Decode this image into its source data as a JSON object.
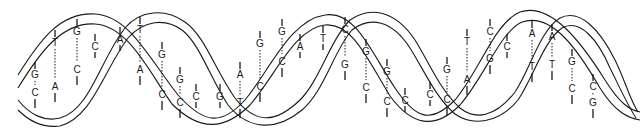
{
  "figure": {
    "stroke_color": "#1a1a1a",
    "background": "#ffffff"
  },
  "base_pairs": [
    {
      "x": 35,
      "top": "G",
      "bottom": "C",
      "ty": 78,
      "by": 96
    },
    {
      "x": 55,
      "top": "T",
      "bottom": "A",
      "ty": 46,
      "by": 90
    },
    {
      "x": 77,
      "top": "G",
      "bottom": "C",
      "ty": 35,
      "by": 73
    },
    {
      "x": 95,
      "top": "C",
      "bottom": "",
      "ty": 50,
      "by": 0
    },
    {
      "x": 120,
      "top": "A",
      "bottom": "",
      "ty": 43,
      "by": 0
    },
    {
      "x": 140,
      "top": "T",
      "bottom": "A",
      "ty": 33,
      "by": 73
    },
    {
      "x": 162,
      "top": "G",
      "bottom": "C",
      "ty": 58,
      "by": 98
    },
    {
      "x": 180,
      "top": "G",
      "bottom": "C",
      "ty": 83,
      "by": 106
    },
    {
      "x": 196,
      "top": "C",
      "bottom": "",
      "ty": 100,
      "by": 0
    },
    {
      "x": 220,
      "top": "G",
      "bottom": "",
      "ty": 100,
      "by": 0
    },
    {
      "x": 240,
      "top": "A",
      "bottom": "T",
      "ty": 78,
      "by": 106
    },
    {
      "x": 260,
      "top": "G",
      "bottom": "C",
      "ty": 47,
      "by": 90
    },
    {
      "x": 282,
      "top": "G",
      "bottom": "C",
      "ty": 35,
      "by": 65
    },
    {
      "x": 300,
      "top": "A",
      "bottom": "",
      "ty": 50,
      "by": 0
    },
    {
      "x": 323,
      "top": "T",
      "bottom": "",
      "ty": 42,
      "by": 0
    },
    {
      "x": 345,
      "top": "C",
      "bottom": "G",
      "ty": 33,
      "by": 68
    },
    {
      "x": 366,
      "top": "G",
      "bottom": "C",
      "ty": 55,
      "by": 91
    },
    {
      "x": 387,
      "top": "G",
      "bottom": "C",
      "ty": 75,
      "by": 105
    },
    {
      "x": 405,
      "top": "C",
      "bottom": "",
      "ty": 104,
      "by": 0
    },
    {
      "x": 430,
      "top": "C",
      "bottom": "",
      "ty": 98,
      "by": 0
    },
    {
      "x": 447,
      "top": "G",
      "bottom": "C",
      "ty": 73,
      "by": 103
    },
    {
      "x": 467,
      "top": "T",
      "bottom": "A",
      "ty": 45,
      "by": 83
    },
    {
      "x": 490,
      "top": "C",
      "bottom": "G",
      "ty": 35,
      "by": 62
    },
    {
      "x": 507,
      "top": "C",
      "bottom": "",
      "ty": 50,
      "by": 0
    },
    {
      "x": 532,
      "top": "A",
      "bottom": "T",
      "ty": 37,
      "by": 70
    },
    {
      "x": 552,
      "top": "A",
      "bottom": "T",
      "ty": 40,
      "by": 68
    },
    {
      "x": 572,
      "top": "G",
      "bottom": "C",
      "ty": 65,
      "by": 92
    },
    {
      "x": 593,
      "top": "C",
      "bottom": "G",
      "ty": 90,
      "by": 106
    }
  ]
}
